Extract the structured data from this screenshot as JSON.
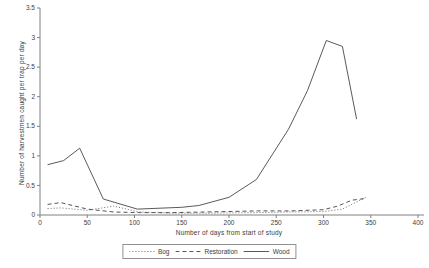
{
  "chart_data": {
    "type": "line",
    "title": "",
    "xlabel": "Number of days from start of study",
    "ylabel": "Number of harvestmen caught per trap per day",
    "xlim": [
      0,
      400
    ],
    "ylim": [
      0,
      3.5
    ],
    "xticks": [
      0,
      50,
      100,
      150,
      200,
      250,
      300,
      350,
      400
    ],
    "yticks": [
      0,
      0.5,
      1,
      1.5,
      2,
      2.5,
      3,
      3.5
    ],
    "grid": "off",
    "legend_position": "bottom-center",
    "colors": {
      "line": "#5a5a5a",
      "axis": "#808080",
      "text": "#3c3c3c",
      "background": "#ffffff",
      "legend_border": "#909090"
    },
    "series": [
      {
        "name": "Bog",
        "style": "dotted",
        "color": "#6a6a6a",
        "points": [
          [
            8,
            0.11
          ],
          [
            22,
            0.12
          ],
          [
            50,
            0.08
          ],
          [
            78,
            0.15
          ],
          [
            105,
            0.05
          ],
          [
            140,
            0.03
          ],
          [
            175,
            0.03
          ],
          [
            230,
            0.04
          ],
          [
            265,
            0.05
          ],
          [
            300,
            0.06
          ],
          [
            320,
            0.1
          ],
          [
            335,
            0.22
          ],
          [
            345,
            0.3
          ]
        ]
      },
      {
        "name": "Restoration",
        "style": "dashed",
        "color": "#555555",
        "points": [
          [
            8,
            0.18
          ],
          [
            22,
            0.21
          ],
          [
            50,
            0.1
          ],
          [
            78,
            0.05
          ],
          [
            105,
            0.04
          ],
          [
            140,
            0.04
          ],
          [
            175,
            0.05
          ],
          [
            230,
            0.07
          ],
          [
            265,
            0.07
          ],
          [
            300,
            0.09
          ],
          [
            315,
            0.15
          ],
          [
            330,
            0.25
          ],
          [
            345,
            0.28
          ]
        ]
      },
      {
        "name": "Wood",
        "style": "solid",
        "color": "#5a5a5a",
        "points": [
          [
            8,
            0.85
          ],
          [
            25,
            0.92
          ],
          [
            42,
            1.13
          ],
          [
            67,
            0.27
          ],
          [
            103,
            0.1
          ],
          [
            150,
            0.13
          ],
          [
            168,
            0.16
          ],
          [
            200,
            0.3
          ],
          [
            229,
            0.6
          ],
          [
            263,
            1.45
          ],
          [
            283,
            2.1
          ],
          [
            303,
            2.95
          ],
          [
            320,
            2.85
          ],
          [
            335,
            1.62
          ]
        ]
      }
    ]
  }
}
